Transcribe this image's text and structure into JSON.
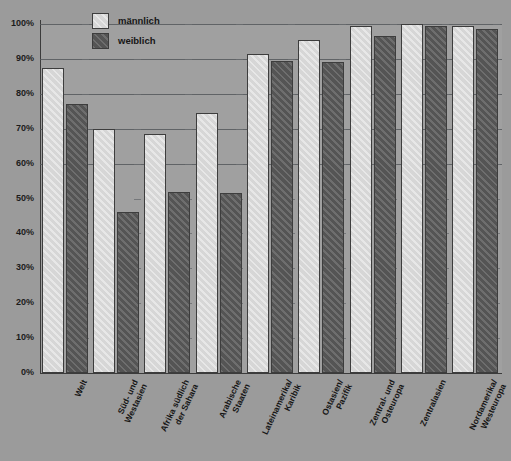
{
  "chart_data": {
    "type": "bar",
    "title": "",
    "subtitle": "",
    "xlabel": "",
    "ylabel": "",
    "ylim": [
      0,
      100
    ],
    "y_unit": "%",
    "grid": true,
    "legend_position": "top-left-inside",
    "categories": [
      "Welt",
      "Süd- und Westasien",
      "Afrika südlich der Sahara",
      "Arabische Staaten",
      "Lateinamerika/ Karibik",
      "Ostasien/ Pazifik",
      "Zentral- und Osteuropa",
      "Zentralasien",
      "Nordamerika/ Westeuropa"
    ],
    "categories_lines": [
      [
        "Welt"
      ],
      [
        "Süd- und",
        "Westasien"
      ],
      [
        "Afrika südlich",
        "der Sahara"
      ],
      [
        "Arabische",
        "Staaten"
      ],
      [
        "Lateinamerika/",
        "Karibik"
      ],
      [
        "Ostasien/",
        "Pazifik"
      ],
      [
        "Zentral- und",
        "Osteuropa"
      ],
      [
        "Zentralasien"
      ],
      [
        "Nordamerika/",
        "Westeuropa"
      ]
    ],
    "series": [
      {
        "name": "männlich",
        "color": "#dedede",
        "values": [
          87.5,
          70.0,
          68.5,
          74.5,
          91.5,
          95.5,
          99.5,
          100.0,
          99.5
        ]
      },
      {
        "name": "weiblich",
        "color": "#5e5e5e",
        "values": [
          77.0,
          46.0,
          52.0,
          51.5,
          89.5,
          89.0,
          96.5,
          99.5,
          98.5
        ]
      }
    ],
    "y_ticks": [
      {
        "value": 100,
        "label": "100%"
      },
      {
        "value": 90,
        "label": "90%"
      },
      {
        "value": 80,
        "label": "80%"
      },
      {
        "value": 70,
        "label": "70%"
      },
      {
        "value": 60,
        "label": "60%"
      },
      {
        "value": 50,
        "label": "50%"
      },
      {
        "value": 40,
        "label": "40%"
      },
      {
        "value": 30,
        "label": "30%"
      },
      {
        "value": 20,
        "label": "20%"
      },
      {
        "value": 10,
        "label": "10%"
      },
      {
        "value": 0,
        "label": "0%"
      }
    ]
  },
  "legend": {
    "items": [
      {
        "label": "männlich",
        "key": "male"
      },
      {
        "label": "weiblich",
        "key": "female"
      }
    ]
  },
  "colors": {
    "background": "#9b9b9b",
    "plot_background": "#a0a0a0",
    "axis": "#3b3b3b",
    "gridline": "#55585c",
    "male_bar": "#dedede",
    "female_bar": "#5e5e5e",
    "bar_border": "#3d3d3d",
    "text": "#161616"
  }
}
